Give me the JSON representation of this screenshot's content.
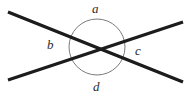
{
  "figure": {
    "name": "intersecting-lines-angles-diagram",
    "background_color": "#ffffff",
    "width": 191,
    "height": 95
  },
  "chart_data": {
    "type": "diagram",
    "title": "",
    "subtitle": "",
    "xlabel": "",
    "ylabel": "",
    "grid": false,
    "legend": null,
    "intersection_point": {
      "x": 97,
      "y": 48
    },
    "circle": {
      "name": "angle-circle",
      "center_x": 97,
      "center_y": 47,
      "radius": 28,
      "stroke_color": "#7a7a7a",
      "stroke_width": 1,
      "fill": "none"
    },
    "lines": [
      {
        "name": "line-descending",
        "x1": 8,
        "y1": 12,
        "x2": 183,
        "y2": 82,
        "stroke_color": "#1c1c1c",
        "stroke_width": 3.2
      },
      {
        "name": "line-ascending",
        "x1": 8,
        "y1": 80,
        "x2": 183,
        "y2": 22,
        "stroke_color": "#1c1c1c",
        "stroke_width": 3.2
      }
    ],
    "labels": [
      {
        "id": "a",
        "text": "a",
        "position": "top",
        "x": 98,
        "y": 8
      },
      {
        "id": "b",
        "text": "b",
        "position": "left",
        "x": 52,
        "y": 45
      },
      {
        "id": "c",
        "text": "c",
        "position": "right",
        "x": 140,
        "y": 51
      },
      {
        "id": "d",
        "text": "d",
        "position": "bottom",
        "x": 98,
        "y": 87
      }
    ],
    "label_color": "#2b2b2b"
  },
  "labels": {
    "a": "a",
    "b": "b",
    "c": "c",
    "d": "d"
  }
}
